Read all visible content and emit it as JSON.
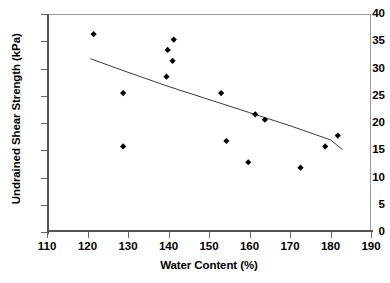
{
  "chart_data": {
    "type": "scatter",
    "title": "",
    "xlabel": "Water Content (%)",
    "ylabel": "Undrained Shear Strength (kPa)",
    "xlim": [
      110,
      190
    ],
    "ylim": [
      0,
      40
    ],
    "xticks": [
      110,
      120,
      130,
      140,
      150,
      160,
      170,
      180,
      190
    ],
    "yticks": [
      0,
      5,
      10,
      15,
      20,
      25,
      30,
      35,
      40
    ],
    "grid": false,
    "legend": null,
    "marker": "diamond",
    "marker_color": "#000000",
    "series": [
      {
        "name": "Undrained shear strength vs water content",
        "points": [
          {
            "x": 121.5,
            "y": 36.3
          },
          {
            "x": 128.8,
            "y": 25.5
          },
          {
            "x": 128.8,
            "y": 15.7
          },
          {
            "x": 139.5,
            "y": 28.5
          },
          {
            "x": 139.8,
            "y": 33.4
          },
          {
            "x": 141.0,
            "y": 31.4
          },
          {
            "x": 141.3,
            "y": 35.3
          },
          {
            "x": 153.0,
            "y": 25.5
          },
          {
            "x": 154.3,
            "y": 16.7
          },
          {
            "x": 159.7,
            "y": 12.8
          },
          {
            "x": 161.4,
            "y": 21.6
          },
          {
            "x": 163.8,
            "y": 20.6
          },
          {
            "x": 172.6,
            "y": 11.8
          },
          {
            "x": 178.7,
            "y": 15.7
          },
          {
            "x": 181.8,
            "y": 17.7
          }
        ]
      }
    ],
    "trendline": {
      "name": "fitted-trend-curve",
      "color": "#3a3a3a",
      "points": [
        {
          "x": 120.7,
          "y": 31.8
        },
        {
          "x": 130.0,
          "y": 29.3
        },
        {
          "x": 140.0,
          "y": 26.7
        },
        {
          "x": 150.0,
          "y": 24.3
        },
        {
          "x": 160.0,
          "y": 21.9
        },
        {
          "x": 170.0,
          "y": 19.5
        },
        {
          "x": 180.0,
          "y": 16.9
        },
        {
          "x": 183.0,
          "y": 15.1
        }
      ]
    }
  },
  "axes": {
    "x_tick_labels": [
      "110",
      "120",
      "130",
      "140",
      "150",
      "160",
      "170",
      "180",
      "190"
    ],
    "y_tick_labels": [
      "0",
      "5",
      "10",
      "15",
      "20",
      "25",
      "30",
      "35",
      "40"
    ]
  }
}
